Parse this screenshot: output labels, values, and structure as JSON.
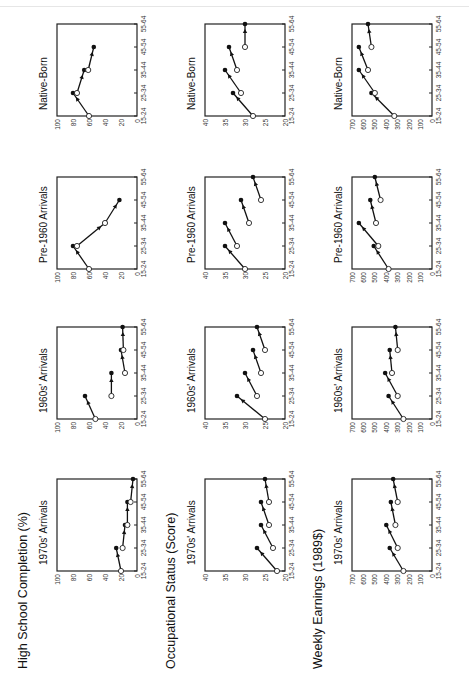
{
  "figure": {
    "orientation": "rotated-90-ccw",
    "row_titles": [
      "High School Completion (%)",
      "Occupational Status (Score)",
      "Weekly Earnings (1989$)"
    ],
    "cohorts": [
      "1970s' Arrivals",
      "1960s' Arrivals",
      "Pre-1960 Arrivals",
      "Native-Born"
    ],
    "x_ticks": [
      "15-24",
      "25-34",
      "35-44",
      "45-54",
      "55-64"
    ]
  },
  "chart_data": [
    {
      "type": "line",
      "title": "High School Completion (%)",
      "ylabel": "High School Completion (%)",
      "xlabel": "Age",
      "ylim": [
        0,
        100
      ],
      "yticks": [
        0,
        20,
        40,
        60,
        80,
        100
      ],
      "categories": [
        "15-24",
        "25-34",
        "35-44",
        "45-54",
        "55-64"
      ],
      "panels": [
        {
          "name": "1970s' Arrivals",
          "start": [
            20,
            18,
            12,
            8,
            null
          ],
          "end": [
            null,
            26,
            15,
            12,
            5
          ]
        },
        {
          "name": "1960s' Arrivals",
          "start": [
            52,
            32,
            15,
            17,
            null
          ],
          "end": [
            null,
            65,
            32,
            20,
            18
          ]
        },
        {
          "name": "Pre-1960 Arrivals",
          "start": [
            60,
            75,
            40,
            25,
            null
          ],
          "end": [
            null,
            80,
            40,
            22,
            null
          ]
        },
        {
          "name": "Native-Born",
          "start": [
            60,
            75,
            61,
            48,
            null
          ],
          "end": [
            null,
            80,
            66,
            54,
            null
          ]
        }
      ],
      "series_note": "open circle = cohort value at first observation; filled circle = value 10 years later (arrow shows change)"
    },
    {
      "type": "line",
      "title": "Occupational Status (Score)",
      "ylabel": "Occupational Status (Score)",
      "xlabel": "Age",
      "ylim": [
        20,
        40
      ],
      "yticks": [
        20,
        25,
        30,
        35,
        40
      ],
      "categories": [
        "15-24",
        "25-34",
        "35-44",
        "45-54",
        "55-64"
      ],
      "panels": [
        {
          "name": "1970s' Arrivals",
          "start": [
            22,
            23,
            24,
            24,
            null
          ],
          "end": [
            null,
            27,
            26,
            26,
            25
          ]
        },
        {
          "name": "1960s' Arrivals",
          "start": [
            25,
            27,
            26,
            25,
            null
          ],
          "end": [
            null,
            32,
            30,
            28,
            27
          ]
        },
        {
          "name": "Pre-1960 Arrivals",
          "start": [
            30,
            32,
            29,
            26,
            null
          ],
          "end": [
            null,
            35,
            35,
            31,
            28
          ]
        },
        {
          "name": "Native-Born",
          "start": [
            28,
            31,
            32,
            30,
            null
          ],
          "end": [
            null,
            33,
            35,
            34,
            30
          ]
        }
      ]
    },
    {
      "type": "line",
      "title": "Weekly Earnings (1989$)",
      "ylabel": "Weekly Earnings (1989$)",
      "xlabel": "Age",
      "ylim": [
        0,
        700
      ],
      "yticks": [
        0,
        100,
        200,
        300,
        400,
        500,
        600,
        700
      ],
      "categories": [
        "15-24",
        "25-34",
        "35-44",
        "45-54",
        "55-64"
      ],
      "panels": [
        {
          "name": "1970s' Arrivals",
          "start": [
            250,
            300,
            320,
            300,
            null
          ],
          "end": [
            null,
            370,
            400,
            360,
            340
          ]
        },
        {
          "name": "1960s' Arrivals",
          "start": [
            250,
            300,
            350,
            300,
            null
          ],
          "end": [
            null,
            380,
            410,
            370,
            320
          ]
        },
        {
          "name": "Pre-1960 Arrivals",
          "start": [
            380,
            470,
            490,
            450,
            null
          ],
          "end": [
            null,
            510,
            640,
            540,
            500
          ]
        },
        {
          "name": "Native-Born",
          "start": [
            330,
            500,
            560,
            530,
            null
          ],
          "end": [
            null,
            530,
            640,
            640,
            560
          ]
        }
      ]
    }
  ]
}
